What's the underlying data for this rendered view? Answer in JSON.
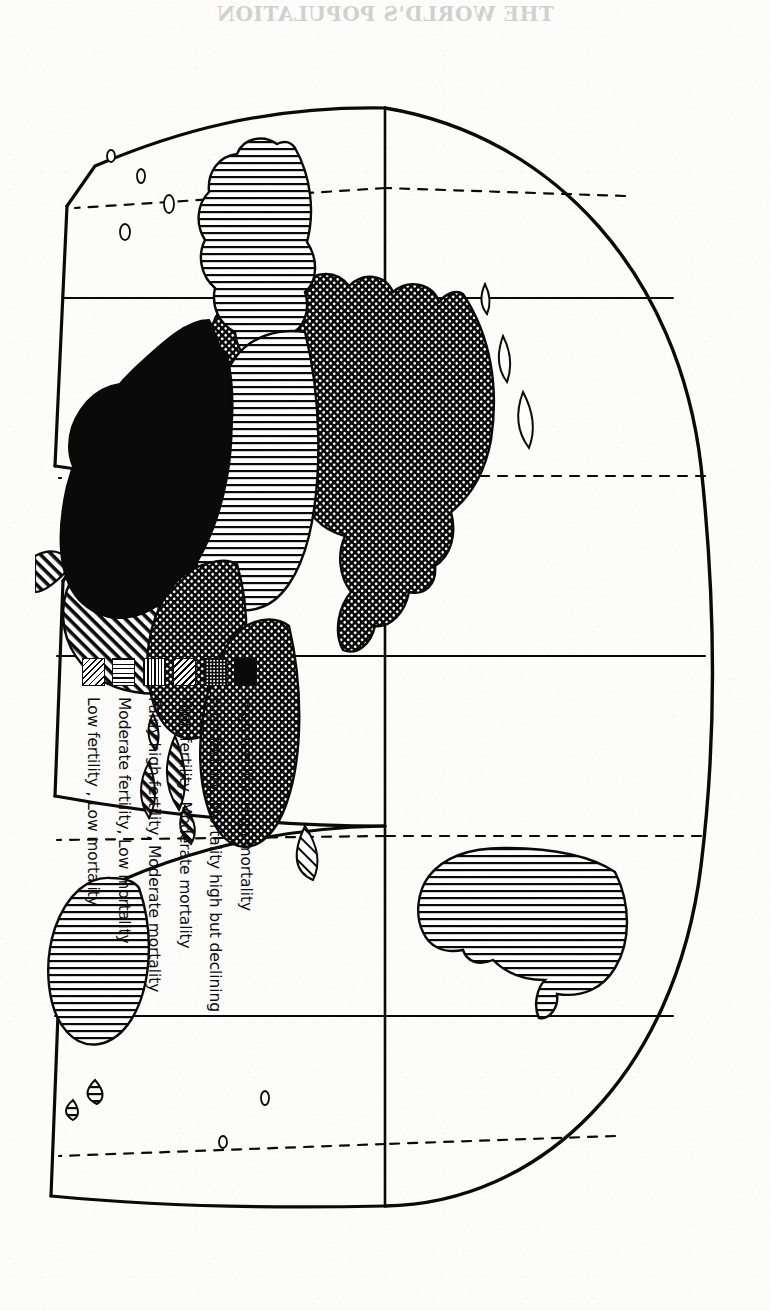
{
  "page": {
    "bleed_through": {
      "title": "THE WORLD'S POPULATION",
      "line1": "represented by colour schemes showing where & when stands. b)",
      "line2": "we (1) a low figure in the country (10). Not , 10. b) any",
      "line3": ""
    }
  },
  "figure": {
    "title": "THE WORLD'S POPULATION",
    "projection": "interrupted (Goode homolosine) world map",
    "orientation_degrees": 90,
    "map_ink_color": "#0a0a0a",
    "paper_color": "#fcfcfa"
  },
  "legend": {
    "title": "",
    "entries": [
      {
        "label": "High fertility, High mortality",
        "pattern": "solid-black",
        "swatch_class": "sw-solid"
      },
      {
        "label": "High fertility, Mortality high but declining",
        "pattern": "dot-grid",
        "swatch_class": "sw-dotgrid"
      },
      {
        "label": "High fertility, Moderate mortality",
        "pattern": "diagonal-hatch",
        "swatch_class": "sw-diag"
      },
      {
        "label": "Fairly high fertility, Moderate mortality",
        "pattern": "horizontal-hatch",
        "swatch_class": "sw-horiz"
      },
      {
        "label": "Moderate fertility, Low mortality",
        "pattern": "vertical-hatch",
        "swatch_class": "sw-vert"
      },
      {
        "label": "Low fertility , Low mortality",
        "pattern": "sparse-diagonal-hatch",
        "swatch_class": "sw-diagthin"
      }
    ]
  },
  "map_regions": [
    {
      "name": "Africa",
      "category": "High fertility, High mortality"
    },
    {
      "name": "Southwest Asia",
      "category": "High fertility, High mortality"
    },
    {
      "name": "South Asia",
      "category": "High fertility, Mortality high but declining"
    },
    {
      "name": "East Asia",
      "category": "High fertility, Mortality high but declining"
    },
    {
      "name": "Southeast Asia",
      "category": "High fertility, Mortality high but declining"
    },
    {
      "name": "Latin America",
      "category": "High fertility, Moderate mortality"
    },
    {
      "name": "Brazil",
      "category": "High fertility, Moderate mortality"
    },
    {
      "name": "Japan",
      "category": "Low fertility , Low mortality"
    },
    {
      "name": "Europe",
      "category": "Moderate fertility, Low mortality"
    },
    {
      "name": "USSR",
      "category": "Moderate fertility, Low mortality"
    },
    {
      "name": "North America",
      "category": "Moderate fertility, Low mortality"
    },
    {
      "name": "Greenland",
      "category": "Moderate fertility, Low mortality"
    },
    {
      "name": "Australia",
      "category": "Moderate fertility, Low mortality"
    },
    {
      "name": "New Zealand",
      "category": "Moderate fertility, Low mortality"
    }
  ]
}
